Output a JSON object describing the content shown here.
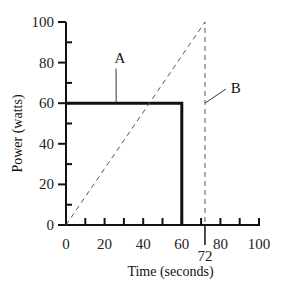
{
  "chart_data": {
    "type": "line",
    "title": "",
    "xlabel": "Time (seconds)",
    "ylabel": "Power (watts)",
    "xlim": [
      0,
      100
    ],
    "ylim": [
      0,
      100
    ],
    "x_ticks": [
      0,
      20,
      40,
      60,
      80,
      100
    ],
    "x_minor_ticks": [
      10,
      30,
      50,
      70,
      90
    ],
    "y_ticks": [
      0,
      20,
      40,
      60,
      80,
      100
    ],
    "y_minor_ticks": [
      10,
      30,
      50,
      70,
      90
    ],
    "x_tick_labels": [
      "0",
      "20",
      "40",
      "60",
      "80",
      "100"
    ],
    "y_tick_labels": [
      "0",
      "20",
      "40",
      "60",
      "80",
      "100"
    ],
    "extra_x_label": {
      "value": 72,
      "text": "72"
    },
    "grid": false,
    "legend": null,
    "series": [
      {
        "name": "A",
        "style": "solid-thick",
        "x": [
          0,
          60,
          60
        ],
        "y": [
          60,
          60,
          0
        ]
      },
      {
        "name": "B",
        "style": "dashed",
        "x": [
          0,
          72,
          72
        ],
        "y": [
          0,
          100,
          0
        ]
      }
    ],
    "annotations": [
      {
        "text": "A",
        "label_pos": [
          28,
          80
        ],
        "points_to": [
          26,
          60
        ]
      },
      {
        "text": "B",
        "label_pos": [
          88,
          65
        ],
        "points_to": [
          72,
          60
        ]
      }
    ]
  }
}
